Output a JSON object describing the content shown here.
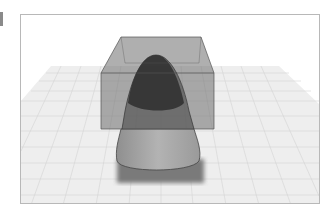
{
  "figure": {
    "colors": {
      "background": "#ffffff",
      "frame_border": "#b8b8b8",
      "grid_plane": "#eeeeee",
      "grid_lines": "#d4d4d4",
      "box_fill": "#6e6e6e",
      "box_edge": "#555555",
      "paraboloid_inside": "#3a3a3a",
      "paraboloid_outside": "#a5a5a5",
      "shadow": "#7a7a7a"
    },
    "elements": [
      "grid-plane",
      "translucent-box",
      "paraboloid",
      "shadow"
    ]
  }
}
